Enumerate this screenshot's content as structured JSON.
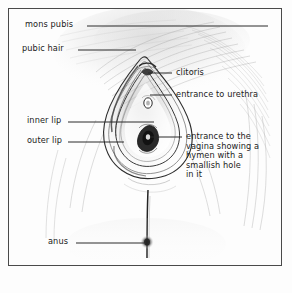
{
  "figure": {
    "type": "anatomical-illustration",
    "width": 292,
    "height": 293,
    "background_color": "#fdfdfd",
    "frame_color": "#4a4a4a",
    "ink_color": "#1b1b1b"
  },
  "labels": {
    "mons_pubis": "mons pubis",
    "pubic_hair": "pubic hair",
    "inner_lip": "inner lip",
    "outer_lip": "outer lip",
    "anus": "anus",
    "clitoris": "clitoris",
    "entrance_to_urethra": "entrance to urethra",
    "entrance_to_vagina": "entrance to the\nvagina showing a\nhymen with a\nsmallish hole\nin it"
  }
}
